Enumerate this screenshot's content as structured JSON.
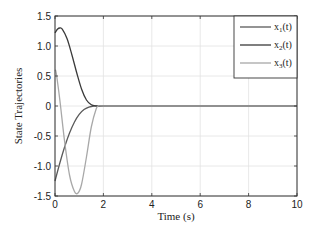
{
  "chart_data": {
    "type": "line",
    "title": "",
    "xlabel": "Time (s)",
    "ylabel": "State Trajectories",
    "xlim": [
      0,
      10
    ],
    "ylim": [
      -1.5,
      1.5
    ],
    "xticks": [
      "0",
      "2",
      "4",
      "6",
      "8",
      "10"
    ],
    "yticks": [
      "1.5",
      "1.0",
      "0.5",
      "0",
      "-0.5",
      "-1.0",
      "-1.5"
    ],
    "grid": true,
    "legend_position": "upper right",
    "series": [
      {
        "name": "x1(t)",
        "label_base": "x",
        "label_sub": "1",
        "label_tail": "(t)",
        "color": "#5a5a5a",
        "x": [
          0,
          0.2,
          0.4,
          0.6,
          0.8,
          1.0,
          1.2,
          1.4,
          1.6,
          1.8,
          2,
          4,
          6,
          8,
          10
        ],
        "y": [
          -1.25,
          -0.95,
          -0.68,
          -0.45,
          -0.27,
          -0.14,
          -0.06,
          -0.02,
          0.0,
          0.0,
          0,
          0,
          0,
          0,
          0
        ]
      },
      {
        "name": "x2(t)",
        "label_base": "x",
        "label_sub": "2",
        "label_tail": "(t)",
        "color": "#3a3a3a",
        "x": [
          0,
          0.1,
          0.2,
          0.3,
          0.5,
          0.7,
          0.9,
          1.1,
          1.3,
          1.5,
          1.7,
          1.8,
          2,
          4,
          6,
          8,
          10
        ],
        "y": [
          1.22,
          1.28,
          1.3,
          1.28,
          1.12,
          0.85,
          0.55,
          0.28,
          0.1,
          0.02,
          0.0,
          0.0,
          0,
          0,
          0,
          0,
          0
        ]
      },
      {
        "name": "x3(t)",
        "label_base": "x",
        "label_sub": "3",
        "label_tail": "(t)",
        "color": "#a8a8a8",
        "x": [
          0,
          0.05,
          0.2,
          0.4,
          0.6,
          0.8,
          0.95,
          1.1,
          1.3,
          1.5,
          1.7,
          1.8,
          2,
          4,
          6,
          8,
          10
        ],
        "y": [
          0.6,
          0.55,
          0.1,
          -0.6,
          -1.15,
          -1.42,
          -1.45,
          -1.3,
          -0.85,
          -0.35,
          -0.05,
          0.0,
          0,
          0,
          0,
          0,
          0
        ]
      }
    ]
  }
}
